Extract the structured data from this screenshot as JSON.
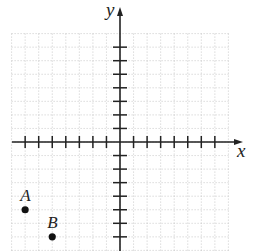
{
  "axes": {
    "x_label": "x",
    "y_label": "y",
    "origin_px": [
      120,
      142
    ],
    "unit_px": 13.55,
    "x_ticks": [
      -7,
      -6,
      -5,
      -4,
      -3,
      -2,
      -1,
      1,
      2,
      3,
      4,
      5,
      6,
      7
    ],
    "y_ticks_visible": [
      -7,
      -6,
      -5,
      -4,
      -3,
      -2,
      -1,
      1,
      2,
      3,
      4,
      5,
      6,
      7
    ],
    "grid": {
      "x_range": [
        -8,
        8
      ],
      "y_range": [
        -8,
        8
      ],
      "style": "dotted"
    }
  },
  "points": [
    {
      "label": "A",
      "x": -7,
      "y": -5
    },
    {
      "label": "B",
      "x": -5,
      "y": -7
    }
  ],
  "colors": {
    "axis": "#222222",
    "grid": "#bbbbbb",
    "point": "#111111"
  }
}
